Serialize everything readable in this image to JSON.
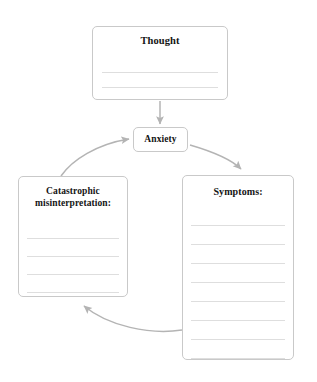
{
  "worksheet": {
    "name": "anxiety-cycle-worksheet",
    "background_color": "#ffffff",
    "border_color": "#c9c9c9",
    "rule_line_color": "#dedede",
    "arrow_color": "#b4b4b4",
    "text_color": "#141414"
  },
  "nodes": {
    "thought": {
      "title": "Thought",
      "write_lines": 2
    },
    "anxiety": {
      "title": "Anxiety"
    },
    "catastrophic": {
      "title_line_1": "Catastrophic",
      "title_line_2": "misinterpretation:",
      "write_lines": 4
    },
    "symptoms": {
      "title": "Symptoms:",
      "write_lines": 8
    }
  },
  "connectors": [
    {
      "name": "thought-to-anxiety-arrow",
      "from": "thought",
      "to": "anxiety",
      "shape": "straight-down"
    },
    {
      "name": "anxiety-to-symptoms-arrow",
      "from": "anxiety",
      "to": "symptoms",
      "shape": "curve-right-down"
    },
    {
      "name": "symptoms-to-catastrophic-arrow",
      "from": "symptoms",
      "to": "catastrophic",
      "shape": "curve-bottom-left"
    },
    {
      "name": "catastrophic-to-anxiety-arrow",
      "from": "catastrophic",
      "to": "anxiety",
      "shape": "curve-left-up"
    }
  ]
}
